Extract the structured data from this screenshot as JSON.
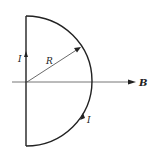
{
  "diagram": {
    "title": "",
    "labels": {
      "current_left": "I",
      "radius": "R",
      "field": "B",
      "current_arc": "I"
    },
    "colors": {
      "stroke": "#222222",
      "axis": "#555555",
      "background": "#ffffff"
    }
  }
}
